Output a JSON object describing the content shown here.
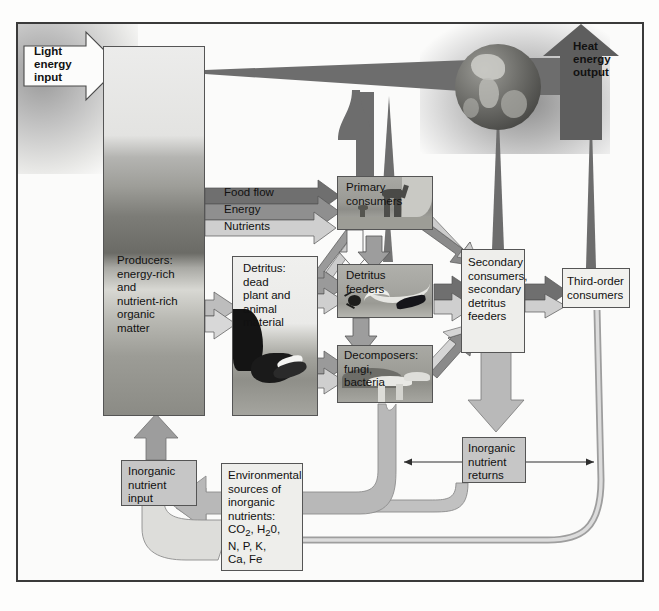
{
  "diagram": {
    "colors": {
      "food_flow": "#6f6f6f",
      "energy": "#8f8f8f",
      "nutrients": "#c9c9c9",
      "heat": "#666666",
      "box_shade": "#c9c9c9",
      "box_plain": "#f2f2ef",
      "border": "#3a3a3a"
    },
    "inputs": [
      {
        "name": "light-energy-input",
        "label": "Light\nenergy\ninput",
        "lines": [
          "Light",
          "energy",
          "input"
        ]
      },
      {
        "name": "inorganic-nutrient-input",
        "label": "Inorganic\nnutrient\ninput",
        "lines": [
          "Inorganic",
          "nutrient",
          "input"
        ]
      }
    ],
    "outputs": [
      {
        "name": "heat-energy-output",
        "lines": [
          "Heat",
          "energy",
          "output"
        ]
      }
    ],
    "legend": {
      "title": "Flow key",
      "items": [
        {
          "label": "Food flow",
          "color": "#6f6f6f"
        },
        {
          "label": "Energy",
          "color": "#8f8f8f"
        },
        {
          "label": "Nutrients",
          "color": "#c9c9c9"
        }
      ]
    },
    "nodes": [
      {
        "name": "producers",
        "lines": [
          "Producers:",
          "energy-rich",
          "and",
          "nutrient-rich",
          "organic",
          "matter"
        ]
      },
      {
        "name": "detritus",
        "lines": [
          "Detritus:",
          "dead",
          "plant and",
          "animal",
          "material"
        ]
      },
      {
        "name": "primary-consumers",
        "lines": [
          "Primary",
          "consumers"
        ]
      },
      {
        "name": "detritus-feeders",
        "lines": [
          "Detritus",
          "feeders"
        ]
      },
      {
        "name": "decomposers",
        "lines": [
          "Decomposers:",
          "fungi,",
          "bacteria"
        ]
      },
      {
        "name": "secondary-consumers",
        "lines": [
          "Secondary",
          "consumers,",
          "secondary",
          "detritus",
          "feeders"
        ]
      },
      {
        "name": "third-order-consumers",
        "lines": [
          "Third-order",
          "consumers"
        ]
      },
      {
        "name": "inorganic-nutrient-returns",
        "lines": [
          "Inorganic",
          "nutrient",
          "returns"
        ]
      },
      {
        "name": "environmental-sources",
        "lines": [
          "Environmental",
          "sources of",
          "inorganic",
          "nutrients:",
          "CO2, H20,",
          "N, P, K,",
          "Ca, Fe"
        ]
      }
    ],
    "environmental_sources_chemicals": [
      "CO2",
      "H20",
      "N",
      "P",
      "K",
      "Ca",
      "Fe"
    ]
  }
}
